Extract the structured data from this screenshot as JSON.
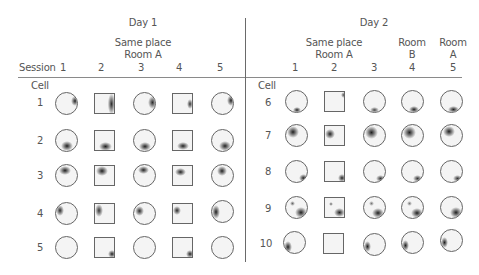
{
  "header": {
    "session_label": "Session",
    "cell_label_day1": "Cell",
    "cell_label_day2": "Cell"
  },
  "days": [
    {
      "title": "Day 1",
      "group_label_line1": "Same place",
      "group_label_line2": "Room A",
      "sessions": [
        "1",
        "2",
        "3",
        "4",
        "5"
      ],
      "cells": [
        "1",
        "2",
        "3",
        "4",
        "5"
      ]
    },
    {
      "title": "Day 2",
      "group_label_line1": "Same place",
      "group_label_line2": "Room A",
      "room_b_line1": "Room",
      "room_b_line2": "B",
      "room_a_line1": "Room",
      "room_a_line2": "A",
      "sessions": [
        "1",
        "2",
        "3",
        "4",
        "5"
      ],
      "cells": [
        "6",
        "7",
        "8",
        "9",
        "10"
      ]
    }
  ],
  "arena_shapes_by_session": [
    "circle",
    "square",
    "circle",
    "square",
    "circle"
  ],
  "arena_shapes_day2_by_session": [
    "circle",
    "square",
    "circle",
    "circle",
    "circle"
  ],
  "firing_fields": {
    "day1": [
      {
        "cell": "1",
        "location": "right / upper-right edge"
      },
      {
        "cell": "2",
        "location": "bottom"
      },
      {
        "cell": "3",
        "location": "top-left"
      },
      {
        "cell": "4",
        "location": "left / upper-left edge"
      },
      {
        "cell": "5",
        "location": "weak; bottom-right in squares"
      }
    ],
    "day2": [
      {
        "cell": "6",
        "location": "bottom edge"
      },
      {
        "cell": "7",
        "location": "upper-left"
      },
      {
        "cell": "8",
        "location": "bottom-right"
      },
      {
        "cell": "9",
        "location": "bottom-right + small upper-left spot"
      },
      {
        "cell": "10",
        "location": "left edge; none in square"
      }
    ]
  },
  "colors": {
    "field_fill": "#f4f4f4",
    "field_border": "#666666",
    "firing": "#2a2a2a",
    "text": "#555555",
    "rule": "#8a8a8a"
  }
}
